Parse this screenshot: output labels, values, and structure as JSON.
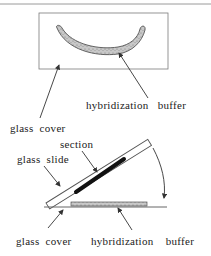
{
  "figure": {
    "top_panel": {
      "label_buffer": "hybridization   buffer",
      "label_cover": "glass  cover"
    },
    "bottom_panel": {
      "label_section": "section",
      "label_slide": "glass  slide",
      "label_cover": "glass  cover",
      "label_buffer": "hybridization    buffer"
    },
    "colors": {
      "stroke": "#555555",
      "buffer_fill": "#b9b9b9",
      "section_fill": "#111111",
      "text": "#222222"
    }
  }
}
